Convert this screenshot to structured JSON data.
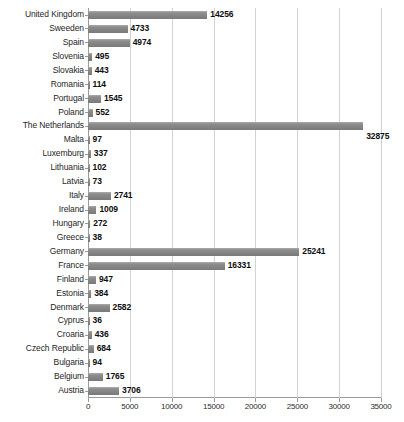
{
  "chart_data": {
    "type": "bar",
    "orientation": "horizontal",
    "title": "",
    "subtitle": "",
    "xlabel": "",
    "ylabel": "",
    "xlim": [
      0,
      35000
    ],
    "xticks": [
      0,
      5000,
      10000,
      15000,
      20000,
      25000,
      30000,
      35000
    ],
    "xtick_labels": [
      "0",
      "5000",
      "10000",
      "15000",
      "20000",
      "25000",
      "30000",
      "35000"
    ],
    "grid": true,
    "legend": "none",
    "data_labels": true,
    "bar_color": "#878787",
    "gridline_color": "#d3d3d3",
    "axis_color": "#9a9a9a",
    "categories": [
      "United Kingdom",
      "Sweeden",
      "Spain",
      "Slovenia",
      "Slovakia",
      "Romania",
      "Portugal",
      "Poland",
      "The Netherlands",
      "Malta",
      "Luxemburg",
      "Lithuania",
      "Latvia",
      "Italy",
      "Ireland",
      "Hungary",
      "Greece",
      "Germany",
      "France",
      "Finland",
      "Estonia",
      "Denmark",
      "Cyprus",
      "Croaria",
      "Czech Republic",
      "Bulgaria",
      "Belgium",
      "Austria"
    ],
    "values": [
      14256,
      4733,
      4974,
      495,
      443,
      114,
      1545,
      552,
      32875,
      97,
      337,
      102,
      73,
      2741,
      1009,
      272,
      38,
      25241,
      16331,
      947,
      384,
      2582,
      36,
      436,
      684,
      94,
      1765,
      3706
    ],
    "value_labels": [
      "14256",
      "4733",
      "4974",
      "495",
      "443",
      "114",
      "1545",
      "552",
      "32875",
      "97",
      "337",
      "102",
      "73",
      "2741",
      "1009",
      "272",
      "38",
      "25241",
      "16331",
      "947",
      "384",
      "2582",
      "36",
      "436",
      "684",
      "94",
      "1765",
      "3706"
    ],
    "label_below_bar": [
      false,
      false,
      false,
      false,
      false,
      false,
      false,
      false,
      true,
      false,
      false,
      false,
      false,
      false,
      false,
      false,
      false,
      false,
      false,
      false,
      false,
      false,
      false,
      false,
      false,
      false,
      false,
      false
    ]
  }
}
